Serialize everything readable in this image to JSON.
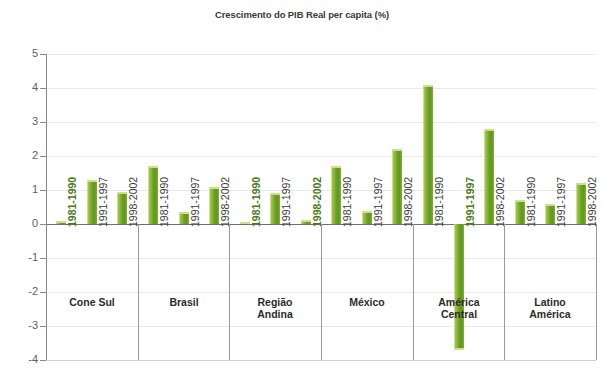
{
  "chart_data": {
    "type": "bar",
    "title": "Crescimento do PIB Real per capita (%)",
    "xlabel": "",
    "ylabel": "",
    "ylim": [
      -4,
      5
    ],
    "ytick_labels": [
      "5",
      "4",
      "3",
      "2",
      "1",
      "0",
      "-1",
      "-2",
      "-3",
      "-4"
    ],
    "ytick_values": [
      5,
      4,
      3,
      2,
      1,
      0,
      -1,
      -2,
      -3,
      -4
    ],
    "grid": true,
    "legend": "none",
    "bar_color": "#6ba12c",
    "periods": [
      "1981-1990",
      "1991-1997",
      "1998-2002"
    ],
    "groups": [
      {
        "label_line1": "Cone Sul",
        "label_line2": "",
        "bars": [
          {
            "period": "1981-1990",
            "value": 0.08
          },
          {
            "period": "1991-1997",
            "value": 1.3
          },
          {
            "period": "1998-2002",
            "value": 0.95
          }
        ]
      },
      {
        "label_line1": "Brasil",
        "label_line2": "",
        "bars": [
          {
            "period": "1981-1990",
            "value": 1.7
          },
          {
            "period": "1991-1997",
            "value": 0.35
          },
          {
            "period": "1998-2002",
            "value": 1.1
          }
        ]
      },
      {
        "label_line1": "Região",
        "label_line2": "Andina",
        "bars": [
          {
            "period": "1981-1990",
            "value": 0.05
          },
          {
            "period": "1991-1997",
            "value": 0.9
          },
          {
            "period": "1998-2002",
            "value": 0.12
          }
        ]
      },
      {
        "label_line1": "México",
        "label_line2": "",
        "bars": [
          {
            "period": "1981-1990",
            "value": 1.7
          },
          {
            "period": "1991-1997",
            "value": 0.38
          },
          {
            "period": "1998-2002",
            "value": 2.2
          }
        ]
      },
      {
        "label_line1": "América",
        "label_line2": "Central",
        "bars": [
          {
            "period": "1981-1990",
            "value": 4.1
          },
          {
            "period": "1991-1997",
            "value": -3.7
          },
          {
            "period": "1998-2002",
            "value": 2.8
          }
        ]
      },
      {
        "label_line1": "Latino",
        "label_line2": "América",
        "bars": [
          {
            "period": "1981-1990",
            "value": 0.7
          },
          {
            "period": "1991-1997",
            "value": 0.6
          },
          {
            "period": "1998-2002",
            "value": 1.2
          }
        ]
      }
    ]
  }
}
